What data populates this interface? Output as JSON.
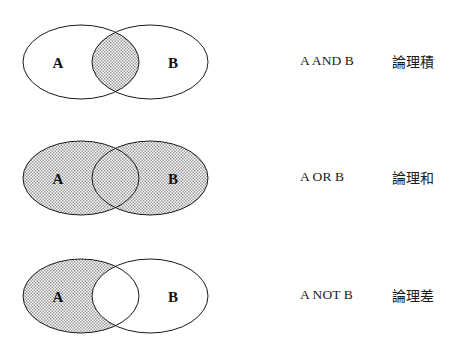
{
  "figure": {
    "background_color": "#ffffff",
    "stroke_color": "#1a1a1a",
    "shade_color": "#c8c8c8",
    "rows": [
      {
        "operation": "AND",
        "expression": "A AND B",
        "term_ja": "論理積",
        "set_a_label": "A",
        "set_b_label": "B",
        "shaded_region": "intersection",
        "top": 18
      },
      {
        "operation": "OR",
        "expression": "A OR B",
        "term_ja": "論理和",
        "set_a_label": "A",
        "set_b_label": "B",
        "shaded_region": "union",
        "top": 134
      },
      {
        "operation": "NOT",
        "expression": "A NOT B",
        "term_ja": "論理差",
        "set_a_label": "A",
        "set_b_label": "B",
        "shaded_region": "a-minus-b",
        "top": 252
      }
    ]
  }
}
